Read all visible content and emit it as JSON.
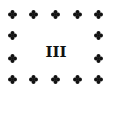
{
  "card": {
    "numeral": "III",
    "ornament_icon": "quatrefoil-clover-icon",
    "ornament_color": "#111111",
    "background": "#ffffff",
    "ornament_positions": [
      {
        "x": 8,
        "y": 10
      },
      {
        "x": 29,
        "y": 10
      },
      {
        "x": 51,
        "y": 10
      },
      {
        "x": 73,
        "y": 10
      },
      {
        "x": 94,
        "y": 10
      },
      {
        "x": 8,
        "y": 31
      },
      {
        "x": 94,
        "y": 31
      },
      {
        "x": 8,
        "y": 54
      },
      {
        "x": 94,
        "y": 54
      },
      {
        "x": 8,
        "y": 75
      },
      {
        "x": 29,
        "y": 75
      },
      {
        "x": 51,
        "y": 75
      },
      {
        "x": 73,
        "y": 75
      },
      {
        "x": 94,
        "y": 75
      }
    ]
  }
}
